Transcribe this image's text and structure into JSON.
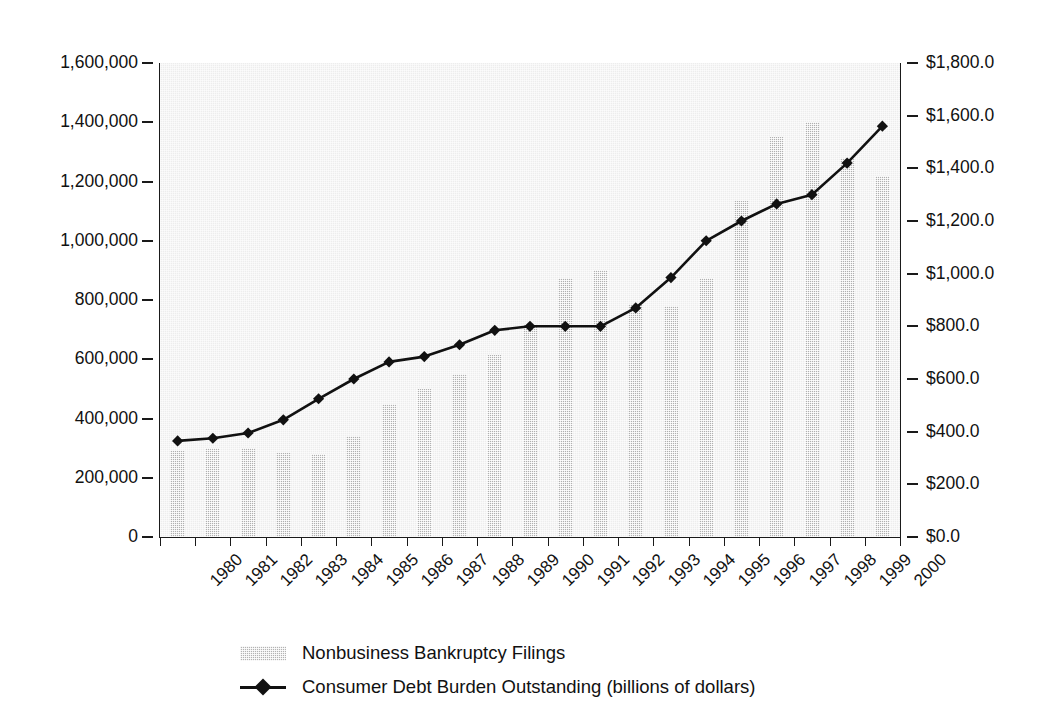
{
  "chart_data": {
    "type": "bar",
    "title": "",
    "subtitle": "",
    "xlabel": "",
    "ylabel": "",
    "grid": false,
    "legend_position": "bottom",
    "categories": [
      "1980",
      "1981",
      "1982",
      "1983",
      "1984",
      "1985",
      "1986",
      "1987",
      "1988",
      "1989",
      "1990",
      "1991",
      "1992",
      "1993",
      "1994",
      "1995",
      "1996",
      "1997",
      "1998",
      "1999",
      "2000"
    ],
    "axes": {
      "left": {
        "label": "",
        "ylim": [
          0,
          1600000
        ],
        "tick_values": [
          0,
          200000,
          400000,
          600000,
          800000,
          1000000,
          1200000,
          1400000,
          1600000
        ],
        "tick_labels": [
          "0",
          "200,000",
          "400,000",
          "600,000",
          "800,000",
          "1,000,000",
          "1,200,000",
          "1,400,000",
          "1,600,000"
        ]
      },
      "right": {
        "label": "",
        "ylim": [
          0,
          1800
        ],
        "tick_values": [
          0,
          200,
          400,
          600,
          800,
          1000,
          1200,
          1400,
          1600,
          1800
        ],
        "tick_labels": [
          "$0.0",
          "$200.0",
          "$400.0",
          "$600.0",
          "$800.0",
          "$1,000.0",
          "$1,200.0",
          "$1,400.0",
          "$1,600.0",
          "$1,800.0"
        ]
      }
    },
    "series": [
      {
        "name": "Nonbusiness Bankruptcy Filings",
        "type": "bar",
        "axis": "left",
        "color": "#b0b0b0",
        "values": [
          290000,
          300000,
          300000,
          285000,
          280000,
          340000,
          450000,
          500000,
          550000,
          615000,
          720000,
          875000,
          900000,
          785000,
          780000,
          875000,
          1135000,
          1350000,
          1400000,
          1280000,
          1220000
        ]
      },
      {
        "name": "Consumer Debt Burden Outstanding (billions of dollars)",
        "type": "line",
        "axis": "right",
        "color": "#111111",
        "marker": "diamond",
        "values": [
          365,
          375,
          395,
          445,
          525,
          600,
          665,
          685,
          730,
          785,
          800,
          800,
          800,
          870,
          985,
          1125,
          1200,
          1265,
          1300,
          1420,
          1560
        ]
      }
    ]
  },
  "legend": {
    "items": [
      {
        "label": "Nonbusiness Bankruptcy Filings",
        "marker": "bar-swatch"
      },
      {
        "label": "Consumer Debt Burden Outstanding (billions of dollars)",
        "marker": "line-diamond"
      }
    ]
  }
}
